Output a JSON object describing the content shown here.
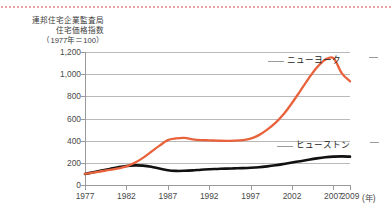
{
  "chart_data": {
    "type": "line",
    "caption_lines": [
      "連邦住宅企業監査局",
      "住宅価格指数",
      "（1977年＝100）"
    ],
    "xlabel": "(年)",
    "ylabel": "",
    "xlim": [
      1977,
      2009
    ],
    "ylim": [
      0,
      1200
    ],
    "yticks": [
      0,
      200,
      400,
      600,
      800,
      1000,
      1200
    ],
    "ytick_labels": [
      "0",
      "200",
      "400",
      "600",
      "800",
      "1,000",
      "1,200"
    ],
    "xticks": [
      1977,
      1982,
      1987,
      1992,
      1997,
      2002,
      2007,
      2009
    ],
    "xtick_labels": [
      "1977",
      "1982",
      "1987",
      "1992",
      "1997",
      "2002",
      "2007",
      "2009"
    ],
    "grid": true,
    "legend_position": "inline-right",
    "series": [
      {
        "name": "ニューヨーク",
        "color": "#E8623C",
        "x": [
          1977,
          1978,
          1979,
          1980,
          1981,
          1982,
          1983,
          1984,
          1985,
          1986,
          1987,
          1988,
          1989,
          1990,
          1991,
          1992,
          1993,
          1994,
          1995,
          1996,
          1997,
          1998,
          1999,
          2000,
          2001,
          2002,
          2003,
          2004,
          2005,
          2006,
          2007,
          2008,
          2009
        ],
        "values": [
          100,
          112,
          124,
          136,
          150,
          168,
          200,
          245,
          300,
          355,
          405,
          420,
          425,
          412,
          405,
          403,
          400,
          398,
          400,
          405,
          418,
          450,
          500,
          560,
          640,
          740,
          850,
          960,
          1060,
          1130,
          1145,
          1010,
          935
        ]
      },
      {
        "name": "ヒューストン",
        "color": "#111111",
        "x": [
          1977,
          1978,
          1979,
          1980,
          1981,
          1982,
          1983,
          1984,
          1985,
          1986,
          1987,
          1988,
          1989,
          1990,
          1991,
          1992,
          1993,
          1994,
          1995,
          1996,
          1997,
          1998,
          1999,
          2000,
          2001,
          2002,
          2003,
          2004,
          2005,
          2006,
          2007,
          2008,
          2009
        ],
        "values": [
          100,
          115,
          130,
          145,
          160,
          172,
          177,
          175,
          165,
          148,
          133,
          127,
          128,
          132,
          138,
          142,
          145,
          148,
          150,
          152,
          155,
          160,
          168,
          178,
          190,
          203,
          215,
          228,
          240,
          250,
          256,
          258,
          256
        ]
      }
    ]
  },
  "labels": {
    "new_york": "ニューヨーク",
    "houston": "ヒューストン",
    "x_unit": "(年)"
  }
}
